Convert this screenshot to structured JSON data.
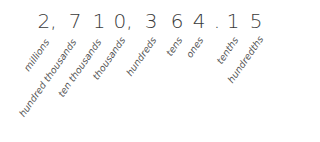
{
  "number": "2,710,364.15",
  "digits": [
    {
      "char": "2,",
      "x": 47
    },
    {
      "char": "7",
      "x": 75
    },
    {
      "char": "1",
      "x": 99
    },
    {
      "char": "0,",
      "x": 123
    },
    {
      "char": "3",
      "x": 151
    },
    {
      "char": "6",
      "x": 177
    },
    {
      "char": "4",
      "x": 199
    },
    {
      "char": ".",
      "x": 217
    },
    {
      "char": "1",
      "x": 233
    },
    {
      "char": "5",
      "x": 256
    }
  ],
  "place_values": [
    {
      "label": "millions",
      "x": 47,
      "y": 40
    },
    {
      "label": "hundred thousands",
      "x": 74,
      "y": 40
    },
    {
      "label": "ten thousands",
      "x": 99,
      "y": 40
    },
    {
      "label": "thousands",
      "x": 123,
      "y": 38
    },
    {
      "label": "hundreds",
      "x": 154,
      "y": 38
    },
    {
      "label": "tens",
      "x": 180,
      "y": 38
    },
    {
      "label": "ones",
      "x": 201,
      "y": 38
    },
    {
      "label": "tenths",
      "x": 236,
      "y": 38
    },
    {
      "label": "hundredths",
      "x": 261,
      "y": 37
    }
  ]
}
